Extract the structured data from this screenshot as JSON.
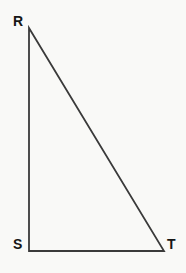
{
  "figure": {
    "kind": "right-triangle",
    "name": "Triangle RST",
    "background_color": "#f9f9f7",
    "stroke_color": "#3a3a3a",
    "label_color": "#161616",
    "stroke_width": 1.8,
    "canvas": {
      "width": 186,
      "height": 273
    },
    "vertices": [
      {
        "id": "R",
        "label": "R",
        "x": 29,
        "y": 28
      },
      {
        "id": "S",
        "label": "S",
        "x": 29,
        "y": 251
      },
      {
        "id": "T",
        "label": "T",
        "x": 164,
        "y": 251
      }
    ],
    "sides": [
      {
        "id": "RS",
        "name": "leg-vertical",
        "from": "R",
        "to": "S"
      },
      {
        "id": "ST",
        "name": "leg-horizontal",
        "from": "S",
        "to": "T"
      },
      {
        "id": "RT",
        "name": "hypotenuse",
        "from": "R",
        "to": "T"
      }
    ],
    "right_angle_at": "S",
    "polygon_points": "29,28 29,251 164,251"
  },
  "labels": {
    "R": "R",
    "S": "S",
    "T": "T"
  }
}
